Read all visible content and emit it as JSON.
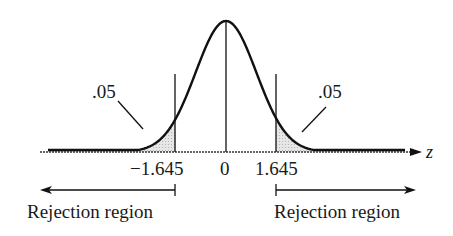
{
  "chart_data": {
    "type": "area",
    "title": "",
    "xlabel": "z",
    "ylabel": "",
    "distribution": "standard normal",
    "mean": 0,
    "critical_values": [
      -1.645,
      1.645
    ],
    "tick_labels": [
      "−1.645",
      "0",
      "1.645"
    ],
    "shaded_regions": [
      {
        "from": "-inf",
        "to": -1.645,
        "area": 0.05,
        "label": ".05"
      },
      {
        "from": 1.645,
        "to": "inf",
        "area": 0.05,
        "label": ".05"
      }
    ],
    "annotations": [
      {
        "text": "Rejection region",
        "side": "left",
        "arrow": "left"
      },
      {
        "text": "Rejection region",
        "side": "right",
        "arrow": "right"
      }
    ],
    "grid": false,
    "legend": null
  },
  "labels": {
    "axis_var": "z",
    "tick_left": "−1.645",
    "tick_center": "0",
    "tick_right": "1.645",
    "area_left": ".05",
    "area_right": ".05",
    "region_left": "Rejection region",
    "region_right": "Rejection region"
  },
  "colors": {
    "curve": "#111111",
    "shade": "#d9d9d9",
    "axis": "#222222"
  }
}
